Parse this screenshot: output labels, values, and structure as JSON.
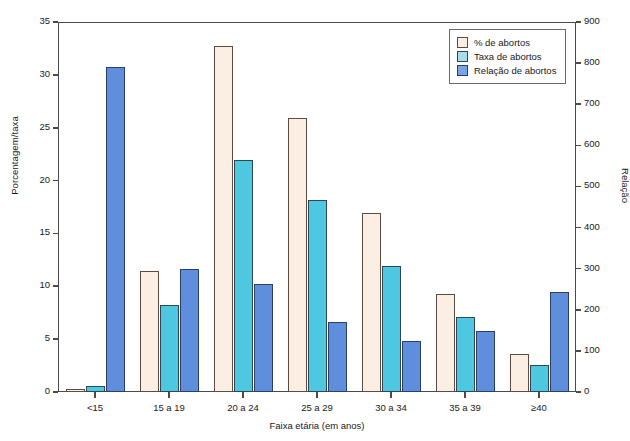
{
  "chart_data": {
    "type": "bar",
    "title": "",
    "xlabel": "Faixa etária (em anos)",
    "ylabel": "Porcentagem/taxa",
    "ylabel_secondary": "Relação",
    "categories": [
      "<15",
      "15 a 19",
      "20 a 24",
      "25 a 29",
      "30 a 34",
      "35 a 39",
      "≥40"
    ],
    "series": [
      {
        "name": "% de abortos",
        "axis": "left",
        "color": "#fbeee3",
        "values": [
          0.3,
          11.4,
          32.7,
          25.9,
          16.9,
          9.3,
          3.6
        ]
      },
      {
        "name": "Taxa de abortos",
        "axis": "left",
        "color": "#4ec8e0",
        "values": [
          0.6,
          8.2,
          21.9,
          18.2,
          11.9,
          7.1,
          2.6
        ]
      },
      {
        "name": "Relação de abortos",
        "axis": "right",
        "color": "#5f8edd",
        "values": [
          790,
          298,
          263,
          170,
          123,
          149,
          244
        ]
      }
    ],
    "ylim": [
      0,
      35
    ],
    "yticks": [
      0,
      5,
      10,
      15,
      20,
      25,
      30,
      35
    ],
    "ylim_secondary": [
      0,
      900
    ],
    "yticks_secondary": [
      0,
      100,
      200,
      300,
      400,
      500,
      600,
      700,
      800,
      900
    ],
    "grid": false,
    "legend_position": "top-right",
    "legend_entries": [
      "% de abortos",
      "Taxa de abortos",
      "Relação de abortos"
    ]
  }
}
